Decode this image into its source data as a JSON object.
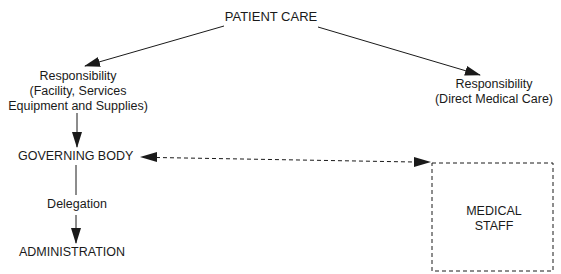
{
  "diagram": {
    "type": "organizational-flow",
    "nodes": {
      "patient_care": {
        "label": "PATIENT CARE"
      },
      "resp_facility": {
        "lines": [
          "Responsibility",
          "(Facility, Services",
          "Equipment and Supplies)"
        ]
      },
      "resp_medical": {
        "lines": [
          "Responsibility",
          "(Direct Medical Care)"
        ]
      },
      "governing_body": {
        "label": "GOVERNING BODY"
      },
      "delegation": {
        "label": "Delegation"
      },
      "administration": {
        "label": "ADMINISTRATION"
      },
      "medical_staff": {
        "lines": [
          "MEDICAL",
          "STAFF"
        ]
      }
    },
    "edges": [
      {
        "from": "PATIENT CARE",
        "to": "Responsibility (Facility, Services Equipment and Supplies)",
        "style": "solid"
      },
      {
        "from": "PATIENT CARE",
        "to": "Responsibility (Direct Medical Care)",
        "style": "solid"
      },
      {
        "from": "Responsibility (Facility, Services Equipment and Supplies)",
        "to": "GOVERNING BODY",
        "style": "solid"
      },
      {
        "from": "GOVERNING BODY",
        "to": "ADMINISTRATION",
        "style": "solid",
        "label": "Delegation"
      },
      {
        "from": "GOVERNING BODY",
        "to": "MEDICAL STAFF",
        "style": "dashed",
        "bidirectional": true
      }
    ],
    "colors": {
      "ink": "#1a1a1a",
      "background": "#ffffff"
    }
  }
}
